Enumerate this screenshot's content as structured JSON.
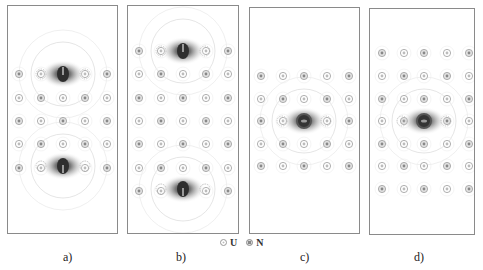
{
  "figure": {
    "panels": [
      {
        "id": "a",
        "label": "a)",
        "box": {
          "x": 7,
          "y": 5,
          "w": 111,
          "h": 229
        },
        "columns": [
          11,
          33,
          55,
          77,
          99
        ],
        "rows": [
          68,
          92,
          115,
          138,
          162
        ],
        "defects": [
          {
            "x": 55,
            "y": 68,
            "shape": "horseshoe-down"
          },
          {
            "x": 55,
            "y": 160,
            "shape": "horseshoe-up"
          }
        ],
        "label_pos": {
          "x": 63,
          "y": 255
        }
      },
      {
        "id": "b",
        "label": "b)",
        "box": {
          "x": 127,
          "y": 5,
          "w": 112,
          "h": 229
        },
        "columns": [
          11,
          33,
          55,
          78,
          100
        ],
        "rows": [
          45,
          68,
          92,
          115,
          138,
          162,
          185
        ],
        "defects": [
          {
            "x": 55,
            "y": 45,
            "shape": "horseshoe-down"
          },
          {
            "x": 55,
            "y": 183,
            "shape": "horseshoe-up"
          }
        ],
        "label_pos": {
          "x": 176,
          "y": 255
        }
      },
      {
        "id": "c",
        "label": "c)",
        "box": {
          "x": 249,
          "y": 7,
          "w": 111,
          "h": 227
        },
        "columns": [
          11,
          33,
          54,
          77,
          99
        ],
        "rows": [
          68,
          91,
          113,
          136,
          158
        ],
        "defects": [
          {
            "x": 54,
            "y": 113,
            "shape": "ring"
          }
        ],
        "label_pos": {
          "x": 300,
          "y": 255
        }
      },
      {
        "id": "d",
        "label": "d)",
        "box": {
          "x": 369,
          "y": 8,
          "w": 106,
          "h": 227
        },
        "columns": [
          12,
          34,
          54,
          77,
          99
        ],
        "rows": [
          44,
          67,
          90,
          112,
          135,
          157,
          180
        ],
        "defects": [
          {
            "x": 54,
            "y": 112,
            "shape": "ring"
          }
        ],
        "label_pos": {
          "x": 414,
          "y": 255
        }
      }
    ],
    "legend": {
      "items": [
        {
          "symbol": "U-atom",
          "label": "U"
        },
        {
          "symbol": "N-atom",
          "label": "N"
        }
      ]
    },
    "colors": {
      "border": "#8a8a8a",
      "atom_ring": "#9a9a9a",
      "contour": "#d4d4d4",
      "defect_core": "#2a2a2a",
      "defect_halo": "#7a7a7a"
    }
  }
}
